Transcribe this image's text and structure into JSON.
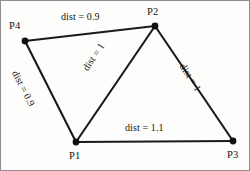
{
  "figure": {
    "type": "graph-diagram",
    "background_color": "#fdfdfc",
    "line_color": "#1a1a1a",
    "text_color": "#17150f"
  },
  "nodes": [
    {
      "id": "P1",
      "label": "P1",
      "x": 75,
      "y": 141,
      "label_x": 68,
      "label_y": 150
    },
    {
      "id": "P2",
      "label": "P2",
      "x": 154,
      "y": 25,
      "label_x": 146,
      "label_y": 6
    },
    {
      "id": "P3",
      "label": "P3",
      "x": 232,
      "y": 140,
      "label_x": 226,
      "label_y": 149
    },
    {
      "id": "P4",
      "label": "P4",
      "x": 24,
      "y": 40,
      "label_x": 8,
      "label_y": 20
    }
  ],
  "edges": [
    {
      "id": "P4-P2",
      "from": "P4",
      "to": "P2",
      "label": "dist = 0.9",
      "label_x": 60,
      "label_y": 11,
      "rotation": 0
    },
    {
      "id": "P4-P1",
      "from": "P4",
      "to": "P1",
      "label": "dist = 0.9",
      "label_x": 18,
      "label_y": 68,
      "rotation": 63
    },
    {
      "id": "P1-P2",
      "from": "P1",
      "to": "P2",
      "label": "dist = 1",
      "label_x": 80,
      "label_y": 66,
      "rotation": -56
    },
    {
      "id": "P2-P3",
      "from": "P2",
      "to": "P3",
      "label": "dist = 1",
      "label_x": 185,
      "label_y": 61,
      "rotation": 57
    },
    {
      "id": "P1-P3",
      "from": "P1",
      "to": "P3",
      "label": "dist = 1.1",
      "label_x": 124,
      "label_y": 122,
      "rotation": 0
    }
  ],
  "chart_data": {
    "type": "diagram",
    "title": "",
    "nodes": [
      "P1",
      "P2",
      "P3",
      "P4"
    ],
    "edges": [
      {
        "source": "P4",
        "target": "P2",
        "weight": 0.9,
        "label": "dist = 0.9"
      },
      {
        "source": "P4",
        "target": "P1",
        "weight": 0.9,
        "label": "dist = 0.9"
      },
      {
        "source": "P1",
        "target": "P2",
        "weight": 1,
        "label": "dist = 1"
      },
      {
        "source": "P2",
        "target": "P3",
        "weight": 1,
        "label": "dist = 1"
      },
      {
        "source": "P1",
        "target": "P3",
        "weight": 1.1,
        "label": "dist = 1.1"
      }
    ]
  }
}
